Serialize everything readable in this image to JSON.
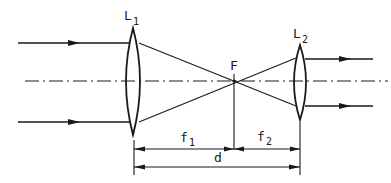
{
  "diagram": {
    "type": "optical-telescope-beam-expander",
    "labels": {
      "lens1_main": "L",
      "lens1_sub": "1",
      "lens2_main": "L",
      "lens2_sub": "2",
      "focal_point": "F",
      "f1_main": "f",
      "f1_sub": "1",
      "f2_main": "f",
      "f2_sub": "2",
      "distance": "d"
    },
    "elements": [
      {
        "id": "lens-L1",
        "kind": "biconvex-lens",
        "position_x": 133
      },
      {
        "id": "lens-L2",
        "kind": "biconvex-lens",
        "position_x": 300
      },
      {
        "id": "focal-point-F",
        "kind": "common-focus",
        "position_x": 234
      },
      {
        "id": "optical-axis",
        "kind": "dash-dot-line"
      },
      {
        "id": "incoming-rays",
        "count": 2,
        "direction": "right"
      },
      {
        "id": "outgoing-rays",
        "count": 2,
        "direction": "right"
      }
    ],
    "dimensions": [
      {
        "label": "f1",
        "from": "L1",
        "to": "F"
      },
      {
        "label": "f2",
        "from": "F",
        "to": "L2"
      },
      {
        "label": "d",
        "from": "L1",
        "to": "L2"
      }
    ],
    "colors": {
      "ink": "#1a1a1a",
      "background": "#ffffff"
    }
  }
}
